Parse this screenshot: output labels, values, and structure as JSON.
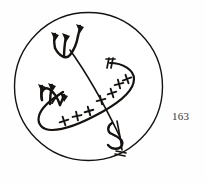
{
  "figure": {
    "number_label": "163",
    "caption": "",
    "title": "",
    "style": "hand-drawn ink line art",
    "frame": {
      "shape": "circle",
      "center_x": 88.5,
      "center_y": 86.5,
      "radius": 74,
      "stroke_color": "#16120f",
      "stroke_width": 1.4,
      "fill_color": "#ffffff"
    },
    "background_color": "#fefefe",
    "ink_color": "#16120f"
  },
  "elements": {
    "axis_vector": {
      "name": "diagonal-axis-arrow",
      "description": "long diagonal shaft running from lower-right to upper-left",
      "start_x": 120,
      "start_y": 138,
      "end_x": 68,
      "end_y": 48,
      "head_type": "trident",
      "head_at": "upper-left"
    },
    "trident_top": {
      "name": "trident-arrowhead-top",
      "description": "three-pronged trident head on the upper end of the diagonal axis",
      "tip_x": 68,
      "tip_y": 48,
      "prong_count": 3
    },
    "trident_left": {
      "name": "trident-arrowhead-left",
      "description": "three-pronged trident head attached to the left end of the ellipse loop",
      "tip_x": 50,
      "tip_y": 98,
      "prong_count": 3
    },
    "hook_bottom": {
      "name": "hook-curl-bottom",
      "description": "S-shaped hooked curl with hatch ticks at the lower end of the diagonal axis",
      "x": 116,
      "y": 136,
      "hatch_count": 2
    },
    "hatch_top_right": {
      "name": "hatch-tick-top-right",
      "description": "short double tick mark where the ellipse loop terminates, upper right",
      "x": 111,
      "y": 62,
      "hatch_count": 2
    },
    "charge_loop": {
      "name": "charge-ellipse-loop",
      "description": "tilted ellipse / closed loop threaded by the diagonal axis",
      "center_x": 86,
      "center_y": 101,
      "radius_x": 46,
      "radius_y": 20,
      "rotation_deg": -22,
      "stroke_color": "#16120f",
      "stroke_width": 2.1
    },
    "charges": {
      "name": "plus-charge-marks",
      "symbol": "+",
      "count": 7,
      "description": "plus charge marks distributed along the ellipse loop",
      "positions": [
        {
          "x": 64,
          "y": 121,
          "rot": -18
        },
        {
          "x": 76,
          "y": 116,
          "rot": -12
        },
        {
          "x": 87,
          "y": 112,
          "rot": -16
        },
        {
          "x": 100,
          "y": 101,
          "rot": -14
        },
        {
          "x": 110,
          "y": 95,
          "rot": -18
        },
        {
          "x": 117,
          "y": 85,
          "rot": -14
        },
        {
          "x": 124,
          "y": 80,
          "rot": -20
        }
      ]
    }
  }
}
